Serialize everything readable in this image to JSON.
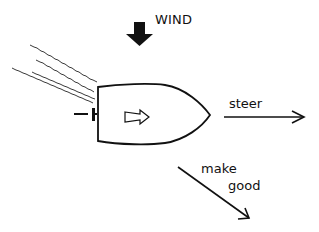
{
  "diagram": {
    "type": "sailing-leeway-diagram",
    "wind": {
      "label": "WIND",
      "direction": "down",
      "icon": "thick-down-arrow-icon"
    },
    "boat": {
      "shape": "hull-top-view",
      "heading": "right",
      "inner_icon": "outline-right-arrow-icon"
    },
    "wake": {
      "lines": 4,
      "direction": "up-left from stern"
    },
    "steer": {
      "label": "steer",
      "direction": "right"
    },
    "make_good": {
      "line1": "make",
      "line2": "good",
      "direction": "down-right"
    },
    "colors": {
      "stroke": "#111111",
      "background": "#ffffff"
    }
  }
}
